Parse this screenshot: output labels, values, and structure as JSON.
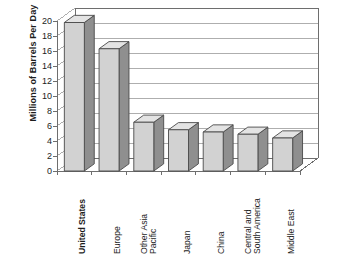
{
  "chart_data": {
    "type": "bar",
    "title": "",
    "subtitle": "",
    "xlabel": "",
    "ylabel": "Millions of Barrels Per Day",
    "ylim": [
      0,
      20
    ],
    "ytick_step": 2,
    "yticks": [
      20,
      18,
      16,
      14,
      12,
      10,
      8,
      6,
      4,
      2,
      0
    ],
    "grid": true,
    "legend": false,
    "style": "3d-bar",
    "categories": [
      "United States",
      "Europe",
      "Other Asia Pacific",
      "Japan",
      "China",
      "Central and South America",
      "Middle East"
    ],
    "values": [
      19.8,
      16.3,
      6.5,
      5.5,
      5.2,
      4.9,
      4.4
    ],
    "series": [
      {
        "name": "Oil consumption",
        "values": [
          19.8,
          16.3,
          6.5,
          5.5,
          5.2,
          4.9,
          4.4
        ]
      }
    ],
    "bar_front_color": "#d2d2d2",
    "bar_side_color": "#8f8f8f",
    "bar_top_color": "#e3e3e3",
    "bar_edge_color": "#4a4a4a",
    "axis_color": "#6e6e6e",
    "grid_color": "#9a9a9a",
    "background_color": "#ffffff"
  },
  "axis": {
    "y_title": "Millions of Barrels Per Day"
  },
  "category_labels": [
    {
      "line1": "United States",
      "line2": "",
      "bold": true
    },
    {
      "line1": "Europe",
      "line2": "",
      "bold": false
    },
    {
      "line1": "Other Asia",
      "line2": "Pacific",
      "bold": false
    },
    {
      "line1": "Japan",
      "line2": "",
      "bold": false
    },
    {
      "line1": "China",
      "line2": "",
      "bold": false
    },
    {
      "line1": "Central and",
      "line2": "South America",
      "bold": false
    },
    {
      "line1": "Middle East",
      "line2": "",
      "bold": false
    }
  ],
  "ticks": {
    "t0": "20",
    "t1": "18",
    "t2": "16",
    "t3": "14",
    "t4": "12",
    "t5": "10",
    "t6": "8",
    "t7": "6",
    "t8": "4",
    "t9": "2",
    "t10": "0"
  }
}
